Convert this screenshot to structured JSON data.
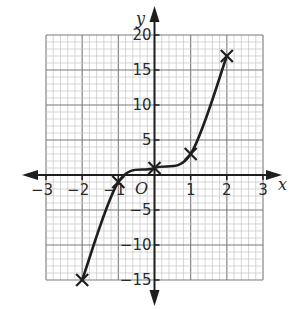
{
  "chart_data": {
    "type": "line",
    "title": "",
    "xlabel": "x",
    "ylabel": "y",
    "origin_label": "O",
    "xlim": [
      -3,
      3
    ],
    "ylim": [
      -15,
      20
    ],
    "grid": true,
    "x_ticks": [
      "-3",
      "-2",
      "-1",
      "1",
      "2",
      "3"
    ],
    "y_ticks": [
      "20",
      "15",
      "10",
      "5",
      "-5",
      "-10",
      "-15"
    ],
    "series": [
      {
        "name": "curve",
        "x": [
          -2,
          -1,
          0,
          1,
          2
        ],
        "y": [
          -15,
          -1,
          1,
          3,
          17
        ],
        "marker": "x",
        "smooth": true
      }
    ],
    "colors": {
      "line": "#1e1e1e",
      "grid_major": "#7a7a7a",
      "grid_minor": "#c4c4c4"
    }
  }
}
